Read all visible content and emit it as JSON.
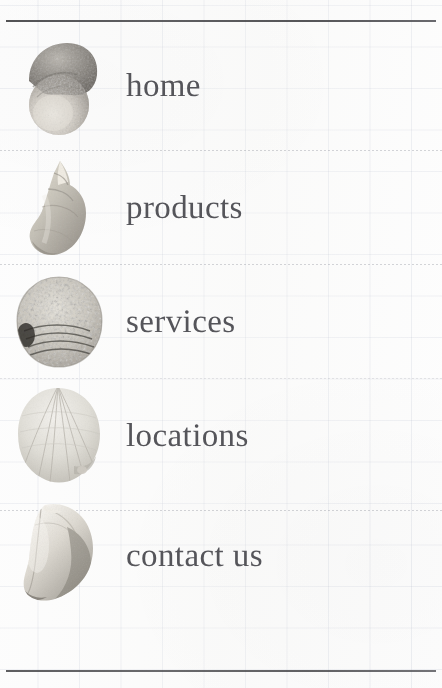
{
  "page": {
    "kind": "printed-navigation-menu",
    "background": "graph-paper-grid",
    "text_color": "#55555a",
    "rule_color": "#3f3f42",
    "grid_color": "#96a0b9"
  },
  "rules": {
    "top_label": "top-rule",
    "bottom_label": "bottom-rule"
  },
  "menu": {
    "items": [
      {
        "label": "home",
        "icon": "spotted-snail-shell-icon",
        "top": 30
      },
      {
        "label": "products",
        "icon": "whelk-shell-icon",
        "top": 152
      },
      {
        "label": "services",
        "icon": "speckled-clam-shell-icon",
        "top": 266
      },
      {
        "label": "locations",
        "icon": "scallop-shell-icon",
        "top": 380
      },
      {
        "label": "contact us",
        "icon": "conch-shell-icon",
        "top": 500
      }
    ],
    "separators": [
      150,
      264,
      378,
      510
    ]
  }
}
